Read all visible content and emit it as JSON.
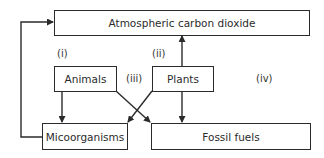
{
  "diagram": {
    "nodes": {
      "atmosphere": "Atmospheric carbon dioxide",
      "animals": "Animals",
      "plants": "Plants",
      "microorganisms": "Micoorganisms",
      "fossil_fuels": "Fossil fuels"
    },
    "labels": {
      "i": "(i)",
      "ii": "(ii)",
      "iii": "(iii)",
      "iv": "(iv)"
    },
    "edges": [
      {
        "from": "plants",
        "to": "atmosphere"
      },
      {
        "from": "microorganisms",
        "to": "atmosphere"
      },
      {
        "from": "animals",
        "to": "microorganisms"
      },
      {
        "from": "animals",
        "to": "fossil_fuels"
      },
      {
        "from": "plants",
        "to": "microorganisms"
      },
      {
        "from": "plants",
        "to": "fossil_fuels"
      }
    ],
    "colors": {
      "stroke": "#2b2b2b",
      "background": "#ffffff"
    }
  }
}
